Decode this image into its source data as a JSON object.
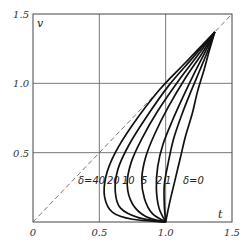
{
  "chart_data": {
    "type": "line",
    "title": "",
    "xlabel": "t",
    "ylabel": "v",
    "xlim": [
      0,
      1.5
    ],
    "ylim": [
      0,
      1.5
    ],
    "grid": true,
    "x_ticks": [
      "0",
      "0.5",
      "1.0",
      "1.5"
    ],
    "y_ticks": [
      "0.5",
      "1.0",
      "1.5"
    ],
    "reference_line": {
      "name": "v = t",
      "style": "dashed",
      "points": [
        [
          0,
          0
        ],
        [
          1.5,
          1.5
        ]
      ]
    },
    "convergence_points": [
      [
        1.0,
        0.0
      ],
      [
        1.37,
        1.37
      ]
    ],
    "series": [
      {
        "name": "δ=40",
        "label": "δ=40",
        "points": [
          [
            1.0,
            0.0
          ],
          [
            0.75,
            0.02
          ],
          [
            0.6,
            0.07
          ],
          [
            0.54,
            0.18
          ],
          [
            0.55,
            0.33
          ],
          [
            0.62,
            0.5
          ],
          [
            0.75,
            0.7
          ],
          [
            0.95,
            0.95
          ],
          [
            1.15,
            1.15
          ],
          [
            1.37,
            1.37
          ]
        ]
      },
      {
        "name": "δ=20",
        "label": "20",
        "points": [
          [
            1.0,
            0.0
          ],
          [
            0.8,
            0.03
          ],
          [
            0.66,
            0.1
          ],
          [
            0.62,
            0.22
          ],
          [
            0.64,
            0.38
          ],
          [
            0.72,
            0.55
          ],
          [
            0.85,
            0.75
          ],
          [
            1.02,
            0.98
          ],
          [
            1.2,
            1.18
          ],
          [
            1.37,
            1.37
          ]
        ]
      },
      {
        "name": "δ=10",
        "label": "10",
        "points": [
          [
            1.0,
            0.0
          ],
          [
            0.85,
            0.04
          ],
          [
            0.75,
            0.13
          ],
          [
            0.71,
            0.27
          ],
          [
            0.74,
            0.43
          ],
          [
            0.82,
            0.6
          ],
          [
            0.94,
            0.8
          ],
          [
            1.09,
            1.01
          ],
          [
            1.24,
            1.2
          ],
          [
            1.37,
            1.37
          ]
        ]
      },
      {
        "name": "δ=5",
        "label": "5",
        "points": [
          [
            1.0,
            0.0
          ],
          [
            0.9,
            0.06
          ],
          [
            0.84,
            0.17
          ],
          [
            0.82,
            0.31
          ],
          [
            0.85,
            0.47
          ],
          [
            0.92,
            0.64
          ],
          [
            1.02,
            0.83
          ],
          [
            1.15,
            1.04
          ],
          [
            1.27,
            1.21
          ],
          [
            1.37,
            1.37
          ]
        ]
      },
      {
        "name": "δ=2",
        "label": "2",
        "points": [
          [
            1.0,
            0.0
          ],
          [
            0.95,
            0.1
          ],
          [
            0.93,
            0.24
          ],
          [
            0.94,
            0.4
          ],
          [
            0.98,
            0.56
          ],
          [
            1.05,
            0.73
          ],
          [
            1.13,
            0.9
          ],
          [
            1.22,
            1.08
          ],
          [
            1.3,
            1.23
          ],
          [
            1.37,
            1.37
          ]
        ]
      },
      {
        "name": "δ=1",
        "label": "1",
        "points": [
          [
            1.0,
            0.0
          ],
          [
            0.99,
            0.12
          ],
          [
            0.99,
            0.27
          ],
          [
            1.02,
            0.43
          ],
          [
            1.06,
            0.6
          ],
          [
            1.12,
            0.77
          ],
          [
            1.19,
            0.94
          ],
          [
            1.26,
            1.1
          ],
          [
            1.32,
            1.24
          ],
          [
            1.37,
            1.37
          ]
        ]
      },
      {
        "name": "δ=0",
        "label": "δ=0",
        "points": [
          [
            1.0,
            0.0
          ],
          [
            1.03,
            0.14
          ],
          [
            1.07,
            0.3
          ],
          [
            1.11,
            0.46
          ],
          [
            1.15,
            0.62
          ],
          [
            1.2,
            0.78
          ],
          [
            1.24,
            0.94
          ],
          [
            1.29,
            1.1
          ],
          [
            1.33,
            1.24
          ],
          [
            1.37,
            1.37
          ]
        ]
      }
    ]
  }
}
